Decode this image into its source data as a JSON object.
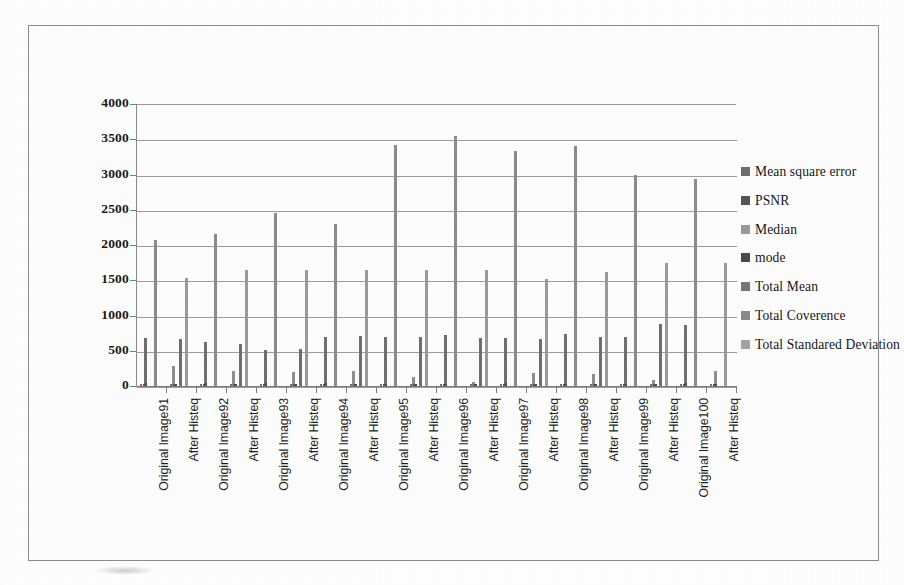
{
  "chart_data": {
    "type": "bar",
    "title": "",
    "xlabel": "",
    "ylabel": "",
    "ylim": [
      0,
      4000
    ],
    "yticks": [
      0,
      500,
      1000,
      1500,
      2000,
      2500,
      3000,
      3500,
      4000
    ],
    "grid": true,
    "legend_position": "right",
    "categories": [
      "Original Image91",
      "After Histeq",
      "Original Image92",
      "After Histeq",
      "Original Image93",
      "After Histeq",
      "Original Image94",
      "After Histeq",
      "Original Image95",
      "After Histeq",
      "Original Image96",
      "After Histeq",
      "Original Image97",
      "After Histeq",
      "Original Image98",
      "After Histeq",
      "Original Image99",
      "After Histeq",
      "Original Image100",
      "After Histeq"
    ],
    "series": [
      {
        "name": "Mean square error",
        "color": "#6e6e6e",
        "values": [
          30,
          25,
          28,
          22,
          26,
          24,
          27,
          23,
          25,
          22,
          24,
          20,
          26,
          23,
          25,
          21,
          24,
          22,
          26,
          23
        ]
      },
      {
        "name": "PSNR",
        "color": "#555555",
        "values": [
          35,
          30,
          33,
          28,
          31,
          29,
          32,
          28,
          30,
          27,
          29,
          26,
          31,
          28,
          30,
          27,
          29,
          27,
          31,
          28
        ]
      },
      {
        "name": "Median",
        "color": "#9a9a9a",
        "values": [
          660,
          280,
          620,
          215,
          510,
          205,
          530,
          215,
          690,
          130,
          700,
          50,
          710,
          190,
          720,
          175,
          700,
          90,
          865,
          200
        ]
      },
      {
        "name": "mode",
        "color": "#4a4a4a",
        "values": [
          40,
          30,
          38,
          28,
          36,
          30,
          37,
          29,
          35,
          28,
          34,
          27,
          36,
          29,
          35,
          28,
          34,
          28,
          38,
          30
        ]
      },
      {
        "name": "Total Mean",
        "color": "#777777",
        "values": [
          680,
          660,
          640,
          600,
          540,
          520,
          700,
          710,
          700,
          690,
          730,
          680,
          680,
          740,
          745,
          700,
          700,
          880,
          870,
          215
        ]
      },
      {
        "name": "Total Coverence",
        "color": "#8a8a8a",
        "values": [
          2065,
          2160,
          2450,
          2300,
          3420,
          3540,
          3340,
          3400,
          2990,
          2930,
          0,
          0,
          0,
          0,
          0,
          0,
          0,
          0,
          0,
          0
        ]
      },
      {
        "name": "Total Standared Deviation",
        "color": "#a3a3a3",
        "values": [
          0,
          1530,
          0,
          1640,
          0,
          1640,
          0,
          1640,
          0,
          1640,
          1640,
          1520,
          1620,
          1620,
          1620,
          1620,
          1620,
          1750,
          0,
          1745
        ]
      }
    ],
    "bars": [
      [
        {
          "series": "Total Mean",
          "value": 680,
          "color": "#6f6f6f"
        },
        {
          "series": "Total Coverence",
          "value": 2065,
          "color": "#8c8c8c"
        }
      ],
      [
        {
          "series": "Median",
          "value": 280,
          "color": "#8f8f8f"
        },
        {
          "series": "Total Mean",
          "value": 660,
          "color": "#6f6f6f"
        },
        {
          "series": "Total Standared Deviation",
          "value": 1530,
          "color": "#9b9b9b"
        }
      ],
      [
        {
          "series": "Total Mean",
          "value": 620,
          "color": "#6f6f6f"
        },
        {
          "series": "Total Coverence",
          "value": 2160,
          "color": "#8c8c8c"
        }
      ],
      [
        {
          "series": "Median",
          "value": 215,
          "color": "#8f8f8f"
        },
        {
          "series": "Total Mean",
          "value": 600,
          "color": "#6f6f6f"
        },
        {
          "series": "Total Standared Deviation",
          "value": 1640,
          "color": "#9b9b9b"
        }
      ],
      [
        {
          "series": "Total Mean",
          "value": 510,
          "color": "#6f6f6f"
        },
        {
          "series": "Total Coverence",
          "value": 2450,
          "color": "#8c8c8c"
        }
      ],
      [
        {
          "series": "Median",
          "value": 205,
          "color": "#8f8f8f"
        },
        {
          "series": "Total Mean",
          "value": 520,
          "color": "#6f6f6f"
        },
        {
          "series": "Total Standared Deviation",
          "value": 1640,
          "color": "#9b9b9b"
        }
      ],
      [
        {
          "series": "Total Mean",
          "value": 700,
          "color": "#6f6f6f"
        },
        {
          "series": "Total Coverence",
          "value": 2300,
          "color": "#8c8c8c"
        }
      ],
      [
        {
          "series": "Median",
          "value": 215,
          "color": "#8f8f8f"
        },
        {
          "series": "Total Mean",
          "value": 710,
          "color": "#6f6f6f"
        },
        {
          "series": "Total Standared Deviation",
          "value": 1640,
          "color": "#9b9b9b"
        }
      ],
      [
        {
          "series": "Total Mean",
          "value": 700,
          "color": "#6f6f6f"
        },
        {
          "series": "Total Coverence",
          "value": 3420,
          "color": "#8c8c8c"
        }
      ],
      [
        {
          "series": "Median",
          "value": 130,
          "color": "#8f8f8f"
        },
        {
          "series": "Total Mean",
          "value": 690,
          "color": "#6f6f6f"
        },
        {
          "series": "Total Standared Deviation",
          "value": 1640,
          "color": "#9b9b9b"
        }
      ],
      [
        {
          "series": "Total Mean",
          "value": 730,
          "color": "#6f6f6f"
        },
        {
          "series": "Total Coverence",
          "value": 3540,
          "color": "#8c8c8c"
        }
      ],
      [
        {
          "series": "Median",
          "value": 50,
          "color": "#8f8f8f"
        },
        {
          "series": "Total Mean",
          "value": 680,
          "color": "#6f6f6f"
        },
        {
          "series": "Total Standared Deviation",
          "value": 1640,
          "color": "#9b9b9b"
        }
      ],
      [
        {
          "series": "Total Mean",
          "value": 680,
          "color": "#6f6f6f"
        },
        {
          "series": "Total Coverence",
          "value": 3340,
          "color": "#8c8c8c"
        }
      ],
      [
        {
          "series": "Median",
          "value": 190,
          "color": "#8f8f8f"
        },
        {
          "series": "Total Mean",
          "value": 660,
          "color": "#6f6f6f"
        },
        {
          "series": "Total Standared Deviation",
          "value": 1520,
          "color": "#9b9b9b"
        }
      ],
      [
        {
          "series": "Total Mean",
          "value": 740,
          "color": "#6f6f6f"
        },
        {
          "series": "Total Coverence",
          "value": 3400,
          "color": "#8c8c8c"
        }
      ],
      [
        {
          "series": "Median",
          "value": 175,
          "color": "#8f8f8f"
        },
        {
          "series": "Total Mean",
          "value": 700,
          "color": "#6f6f6f"
        },
        {
          "series": "Total Standared Deviation",
          "value": 1620,
          "color": "#9b9b9b"
        }
      ],
      [
        {
          "series": "Total Mean",
          "value": 700,
          "color": "#6f6f6f"
        },
        {
          "series": "Total Coverence",
          "value": 2990,
          "color": "#8c8c8c"
        }
      ],
      [
        {
          "series": "Median",
          "value": 90,
          "color": "#8f8f8f"
        },
        {
          "series": "Total Mean",
          "value": 880,
          "color": "#6f6f6f"
        },
        {
          "series": "Total Standared Deviation",
          "value": 1750,
          "color": "#9b9b9b"
        }
      ],
      [
        {
          "series": "Total Mean",
          "value": 870,
          "color": "#6f6f6f"
        },
        {
          "series": "Total Coverence",
          "value": 2930,
          "color": "#8c8c8c"
        }
      ],
      [
        {
          "series": "Median",
          "value": 215,
          "color": "#8f8f8f"
        },
        {
          "series": "Total Standared Deviation",
          "value": 1745,
          "color": "#9b9b9b"
        }
      ]
    ]
  },
  "legend": {
    "items": [
      {
        "label": "Mean square error",
        "color": "#6e6e6e",
        "icon": "legend-swatch-icon"
      },
      {
        "label": "PSNR",
        "color": "#555555",
        "icon": "legend-swatch-icon"
      },
      {
        "label": "Median",
        "color": "#9a9a9a",
        "icon": "legend-swatch-icon"
      },
      {
        "label": "mode",
        "color": "#4a4a4a",
        "icon": "legend-swatch-icon"
      },
      {
        "label": "Total Mean",
        "color": "#777777",
        "icon": "legend-swatch-icon"
      },
      {
        "label": "Total Coverence",
        "color": "#8a8a8a",
        "icon": "legend-swatch-icon"
      },
      {
        "label": "Total Standared Deviation",
        "color": "#a3a3a3",
        "icon": "legend-swatch-icon"
      }
    ]
  },
  "colors": {
    "axis": "#7d7d7d",
    "grid": "#9d9d9d",
    "border": "#8b8b8b",
    "text": "#1b1b1b",
    "background": "#ffffff"
  }
}
